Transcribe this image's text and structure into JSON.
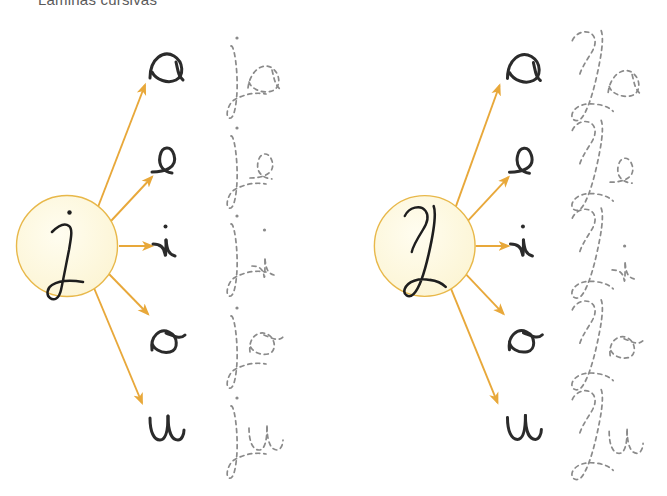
{
  "page": {
    "title": "Laminas cursivas",
    "background_color": "#ffffff",
    "width": 667,
    "height": 496
  },
  "style": {
    "arrow_color": "#e8a83a",
    "circle_fill": "#fdf8dc",
    "circle_stroke": "#e8b84a",
    "letter_color": "#2b2b2b",
    "trace_color": "#8a8a8a",
    "title_color": "#5a5a5a"
  },
  "panels": [
    {
      "id": "lowercase-panel",
      "name": "lowercase-j-panel",
      "hub": {
        "letter": "j",
        "case": "lowercase",
        "center_x": 67,
        "center_y": 246,
        "radius": 51
      },
      "rays": [
        {
          "label": "a",
          "angle_deg": -52
        },
        {
          "label": "e",
          "angle_deg": -28
        },
        {
          "label": "i",
          "angle_deg": 0
        },
        {
          "label": "o",
          "angle_deg": 30
        },
        {
          "label": "u",
          "angle_deg": 55
        }
      ],
      "rows": [
        {
          "target_letter": "a",
          "syllable": "ja",
          "trace_text": "ja",
          "y": 68
        },
        {
          "target_letter": "e",
          "syllable": "je",
          "trace_text": "je",
          "y": 158
        },
        {
          "target_letter": "i",
          "syllable": "ji",
          "trace_text": "ji",
          "y": 245
        },
        {
          "target_letter": "o",
          "syllable": "jo",
          "trace_text": "jo",
          "y": 337
        },
        {
          "target_letter": "u",
          "syllable": "ju",
          "trace_text": "ju",
          "y": 428
        }
      ]
    },
    {
      "id": "uppercase-panel",
      "name": "uppercase-j-panel",
      "hub": {
        "letter": "J",
        "case": "uppercase",
        "center_x": 92,
        "center_y": 246,
        "radius": 50
      },
      "rays": [
        {
          "label": "a",
          "angle_deg": -52
        },
        {
          "label": "e",
          "angle_deg": -28
        },
        {
          "label": "i",
          "angle_deg": 0
        },
        {
          "label": "o",
          "angle_deg": 30
        },
        {
          "label": "u",
          "angle_deg": 55
        }
      ],
      "rows": [
        {
          "target_letter": "a",
          "syllable": "Ja",
          "trace_text": "Ja",
          "y": 68
        },
        {
          "target_letter": "e",
          "syllable": "Je",
          "trace_text": "Je",
          "y": 158
        },
        {
          "target_letter": "i",
          "syllable": "Ji",
          "trace_text": "Ji",
          "y": 245
        },
        {
          "target_letter": "o",
          "syllable": "Jo",
          "trace_text": "Jo",
          "y": 337
        },
        {
          "target_letter": "u",
          "syllable": "Ju",
          "trace_text": "Ju",
          "y": 428
        }
      ]
    }
  ]
}
